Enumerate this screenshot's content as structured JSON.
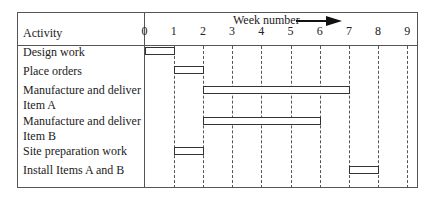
{
  "header": {
    "activity_label": "Activity",
    "week_label": "Week number",
    "weeks": [
      "0",
      "1",
      "2",
      "3",
      "4",
      "5",
      "6",
      "7",
      "8",
      "9"
    ]
  },
  "activities": [
    {
      "name": "Design work",
      "start": 0,
      "end": 1
    },
    {
      "name": "Place orders",
      "start": 1,
      "end": 2
    },
    {
      "name": "Manufacture and deliver Item A",
      "line1": "Manufacture and deliver",
      "line2": "Item A",
      "start": 2,
      "end": 7
    },
    {
      "name": "Manufacture and deliver Item B",
      "line1": "Manufacture and deliver",
      "line2": "Item B",
      "start": 2,
      "end": 6
    },
    {
      "name": "Site preparation work",
      "start": 1,
      "end": 2
    },
    {
      "name": "Install Items A and B",
      "start": 7,
      "end": 8
    }
  ],
  "chart_data": {
    "type": "gantt",
    "title": "",
    "xlabel": "Week number",
    "ylabel": "Activity",
    "x_ticks": [
      0,
      1,
      2,
      3,
      4,
      5,
      6,
      7,
      8,
      9
    ],
    "xlim": [
      0,
      9
    ],
    "grid": "vertical dashed at each week",
    "tasks": [
      {
        "name": "Design work",
        "start": 0,
        "end": 1
      },
      {
        "name": "Place orders",
        "start": 1,
        "end": 2
      },
      {
        "name": "Manufacture and deliver Item A",
        "start": 2,
        "end": 7
      },
      {
        "name": "Manufacture and deliver Item B",
        "start": 2,
        "end": 6
      },
      {
        "name": "Site preparation work",
        "start": 1,
        "end": 2
      },
      {
        "name": "Install Items A and B",
        "start": 7,
        "end": 8
      }
    ]
  }
}
